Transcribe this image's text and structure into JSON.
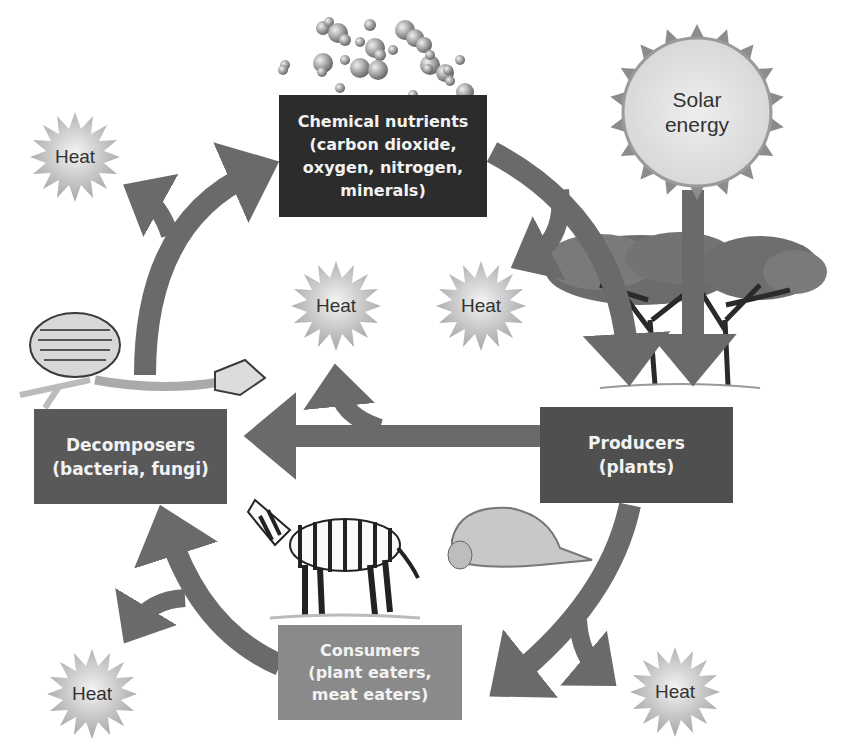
{
  "diagram": {
    "colors": {
      "arrow": "#6a6a6a",
      "chemical_box": "#2c2c2c",
      "producers_box": "#4f4f4f",
      "decomposers_box": "#595959",
      "consumers_box": "#8a8a8a",
      "box_text": "#f2f2f2",
      "heat_fill": "#c8c8c8",
      "sun_fill": "#e6e6e6",
      "sun_rays": "#8c8c8c"
    },
    "nodes": {
      "chemical_nutrients": {
        "line1": "Chemical nutrients",
        "line2": "(carbon dioxide,",
        "line3": "oxygen, nitrogen,",
        "line4": "minerals)"
      },
      "producers": {
        "line1": "Producers",
        "line2": "(plants)"
      },
      "decomposers": {
        "line1": "Decomposers",
        "line2": "(bacteria, fungi)"
      },
      "consumers": {
        "line1": "Consumers",
        "line2": "(plant eaters,",
        "line3": "meat eaters)"
      },
      "solar_energy": {
        "line1": "Solar",
        "line2": "energy"
      }
    },
    "heat_labels": [
      "Heat",
      "Heat",
      "Heat",
      "Heat",
      "Heat",
      "Heat"
    ],
    "illustrations": {
      "molecules": "molecules-cluster",
      "trees": "acacia-trees",
      "skeleton": "animal-skeleton",
      "zebra": "zebra",
      "lioness": "lioness"
    },
    "edges": [
      {
        "from": "Chemical nutrients",
        "to": "Producers"
      },
      {
        "from": "Solar energy",
        "to": "Producers"
      },
      {
        "from": "Producers",
        "to": "Decomposers"
      },
      {
        "from": "Producers",
        "to": "Consumers"
      },
      {
        "from": "Consumers",
        "to": "Decomposers"
      },
      {
        "from": "Decomposers",
        "to": "Chemical nutrients"
      },
      {
        "from": "Chemical nutrients",
        "to": "Heat"
      },
      {
        "from": "Producers",
        "to": "Heat"
      },
      {
        "from": "Consumers",
        "to": "Heat"
      },
      {
        "from": "Decomposers",
        "to": "Heat"
      }
    ]
  }
}
